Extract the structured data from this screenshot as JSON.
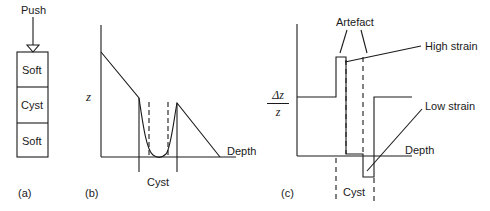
{
  "panel_a": {
    "caption": "(a)",
    "push_label": "Push",
    "layers": [
      "Soft",
      "Cyst",
      "Soft"
    ]
  },
  "panel_b": {
    "caption": "(b)",
    "y_label": "z",
    "x_label": "Depth",
    "region_label": "Cyst"
  },
  "panel_c": {
    "caption": "(c)",
    "y_label_num": "Δz",
    "y_label_den": "z",
    "x_label": "Depth",
    "region_label": "Cyst",
    "annotations": {
      "artefact": "Artefact",
      "high_strain": "High strain",
      "low_strain": "Low strain"
    }
  },
  "colors": {
    "line": "#1a1a1a",
    "background": "#ffffff"
  }
}
